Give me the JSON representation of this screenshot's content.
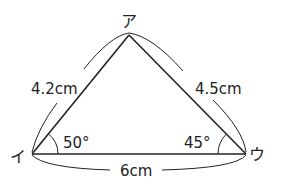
{
  "figure": {
    "type": "triangle",
    "stroke_color": "#222222",
    "background": "#ffffff"
  },
  "vertices": {
    "top": {
      "label": "ア",
      "x": 129,
      "y": 34
    },
    "left": {
      "label": "イ",
      "x": 32,
      "y": 154
    },
    "right": {
      "label": "ウ",
      "x": 246,
      "y": 154
    }
  },
  "sides": {
    "left": {
      "label": "4.2cm"
    },
    "right": {
      "label": "4.5cm"
    },
    "bottom": {
      "label": "6cm"
    }
  },
  "angles": {
    "left": {
      "label": "50°"
    },
    "right": {
      "label": "45°"
    }
  }
}
